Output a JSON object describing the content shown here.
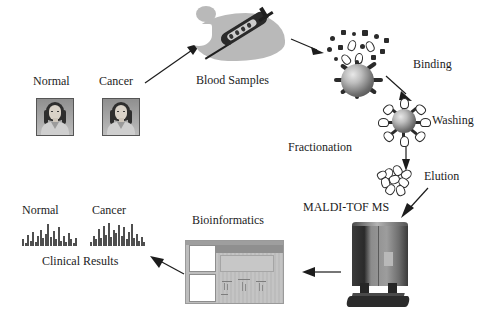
{
  "diagram": {
    "labels": {
      "normal_top": "Normal",
      "cancer_top": "Cancer",
      "blood_samples": "Blood Samples",
      "binding": "Binding",
      "washing": "Washing",
      "elution": "Elution",
      "fractionation": "Fractionation",
      "maldi": "MALDI-TOF MS",
      "bioinformatics": "Bioinformatics",
      "normal_spectrum": "Normal",
      "cancer_spectrum": "Cancer",
      "clinical_results": "Clinical Results"
    },
    "icons": {
      "patient_normal": "patient-portrait-icon",
      "patient_cancer": "patient-portrait-icon",
      "syringe": "syringe-icon",
      "blood_blob": "blood-drop-icon",
      "bead_binding": "magnetic-bead-icon",
      "bead_washing": "magnetic-bead-icon",
      "eluate": "eluted-molecules-icon",
      "mass_spectrometer": "mass-spectrometer-icon",
      "software_window": "software-window-icon",
      "spectrum_normal": "mass-spectrum-icon",
      "spectrum_cancer": "mass-spectrum-icon"
    },
    "colors": {
      "background": "#ffffff",
      "ink": "#1c1c1c",
      "blob": "#b9b9b9",
      "bead_dark": "#3a3a3a",
      "instrument": "#2a2a2a",
      "window_gray": "#c9c9c9"
    },
    "arrows": [
      {
        "name": "patients-to-blood",
        "from": "patients",
        "to": "blood_samples",
        "direction": "up-right"
      },
      {
        "name": "blood-to-binding",
        "from": "blood_samples",
        "to": "binding",
        "direction": "right"
      },
      {
        "name": "binding-to-washing",
        "from": "binding",
        "to": "washing",
        "direction": "down-right"
      },
      {
        "name": "washing-to-elution",
        "from": "washing",
        "to": "elution",
        "direction": "down"
      },
      {
        "name": "elution-to-maldi",
        "from": "elution",
        "to": "maldi",
        "direction": "down-left"
      },
      {
        "name": "maldi-to-bioinformatics",
        "from": "mass_spectrometer",
        "to": "bioinformatics",
        "direction": "left"
      },
      {
        "name": "bioinformatics-to-results",
        "from": "bioinformatics",
        "to": "clinical_results",
        "direction": "left"
      }
    ]
  },
  "chart_data": [
    {
      "type": "bar",
      "title": "Normal",
      "xlabel": "",
      "ylabel": "",
      "categories": [
        "1",
        "2",
        "3",
        "4",
        "5",
        "6",
        "7",
        "8",
        "9",
        "10",
        "11",
        "12",
        "13",
        "14",
        "15",
        "16",
        "17",
        "18",
        "19",
        "20",
        "21",
        "22"
      ],
      "values": [
        6,
        3,
        10,
        5,
        13,
        4,
        9,
        15,
        7,
        11,
        20,
        8,
        14,
        6,
        17,
        5,
        9,
        4,
        12,
        6,
        3,
        7
      ],
      "ylim": [
        0,
        22
      ]
    },
    {
      "type": "bar",
      "title": "Cancer",
      "xlabel": "",
      "ylabel": "",
      "categories": [
        "1",
        "2",
        "3",
        "4",
        "5",
        "6",
        "7",
        "8",
        "9",
        "10",
        "11",
        "12",
        "13",
        "14",
        "15",
        "16",
        "17",
        "18",
        "19",
        "20",
        "21",
        "22"
      ],
      "values": [
        4,
        9,
        6,
        16,
        7,
        18,
        10,
        21,
        8,
        15,
        12,
        19,
        9,
        17,
        6,
        13,
        20,
        7,
        11,
        5,
        8,
        4
      ],
      "ylim": [
        0,
        22
      ]
    }
  ]
}
